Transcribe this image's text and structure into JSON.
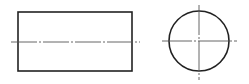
{
  "diagram": {
    "type": "orthographic-projection",
    "views": [
      {
        "name": "front-view",
        "shape": "rectangle",
        "x": 18,
        "y": 12,
        "width": 114,
        "height": 59
      },
      {
        "name": "side-view",
        "shape": "circle",
        "cx": 199,
        "cy": 41,
        "r": 30
      }
    ],
    "centerlines": [
      {
        "name": "rectangle-axis",
        "x1": 11,
        "y1": 42,
        "x2": 140,
        "y2": 42
      },
      {
        "name": "circle-horizontal-axis",
        "x1": 162,
        "y1": 41,
        "x2": 237,
        "y2": 41
      },
      {
        "name": "circle-vertical-axis",
        "x1": 199,
        "y1": 5,
        "x2": 199,
        "y2": 80
      }
    ],
    "colors": {
      "outline": "#222222",
      "centerline": "#555555",
      "background": "#ffffff"
    }
  }
}
